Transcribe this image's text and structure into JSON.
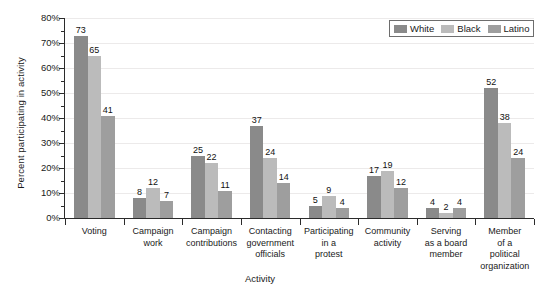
{
  "chart_data": {
    "type": "bar",
    "title": "",
    "xlabel": "Activity",
    "ylabel": "Percent participating in activity",
    "ylim": [
      0,
      80
    ],
    "y_tick_labels": [
      "0%",
      "10%",
      "20%",
      "30%",
      "40%",
      "50%",
      "60%",
      "70%",
      "80%"
    ],
    "y_tick_values": [
      0,
      10,
      20,
      30,
      40,
      50,
      60,
      70,
      80
    ],
    "grid": true,
    "legend_position": "top-right",
    "categories": [
      "Voting",
      "Campaign work",
      "Campaign contributions",
      "Contacting government officials",
      "Participating in a protest",
      "Community activity",
      "Serving as a board member",
      "Member of a political organization"
    ],
    "category_label_lines": [
      [
        "Voting"
      ],
      [
        "Campaign",
        "work"
      ],
      [
        "Campaign",
        "contributions"
      ],
      [
        "Contacting",
        "government",
        "officials"
      ],
      [
        "Participating",
        "in a",
        "protest"
      ],
      [
        "Community",
        "activity"
      ],
      [
        "Serving",
        "as a board",
        "member"
      ],
      [
        "Member",
        "of a",
        "political",
        "organization"
      ]
    ],
    "series": [
      {
        "name": "White",
        "color": "#8a8a8a",
        "values": [
          73,
          8,
          25,
          37,
          5,
          17,
          4,
          52
        ]
      },
      {
        "name": "Black",
        "color": "#bbbbbb",
        "values": [
          65,
          12,
          22,
          24,
          9,
          19,
          2,
          38
        ]
      },
      {
        "name": "Latino",
        "color": "#9e9e9e",
        "values": [
          41,
          7,
          11,
          14,
          4,
          12,
          4,
          24
        ]
      }
    ]
  },
  "legend": {
    "items": [
      {
        "label": "White",
        "color": "#8a8a8a"
      },
      {
        "label": "Black",
        "color": "#bbbbbb"
      },
      {
        "label": "Latino",
        "color": "#9e9e9e"
      }
    ]
  }
}
